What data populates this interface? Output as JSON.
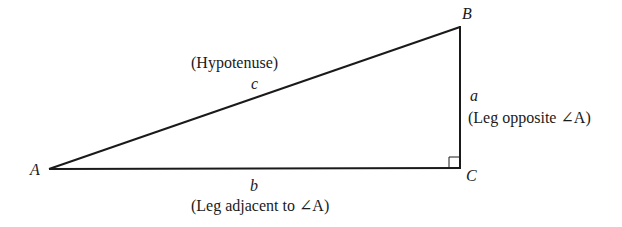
{
  "diagram": {
    "type": "right-triangle",
    "vertices": {
      "A": {
        "label": "A",
        "x": 49,
        "y": 169
      },
      "B": {
        "label": "B",
        "x": 460,
        "y": 27
      },
      "C": {
        "label": "C",
        "x": 460,
        "y": 168
      }
    },
    "sides": {
      "hypotenuse": {
        "var": "c",
        "description": "(Hypotenuse)"
      },
      "opposite": {
        "var": "a",
        "description": "(Leg opposite ∠A)"
      },
      "adjacent": {
        "var": "b",
        "description": "(Leg adjacent to ∠A)"
      }
    },
    "right_angle_at": "C",
    "stroke_color": "#1a1a1a"
  }
}
